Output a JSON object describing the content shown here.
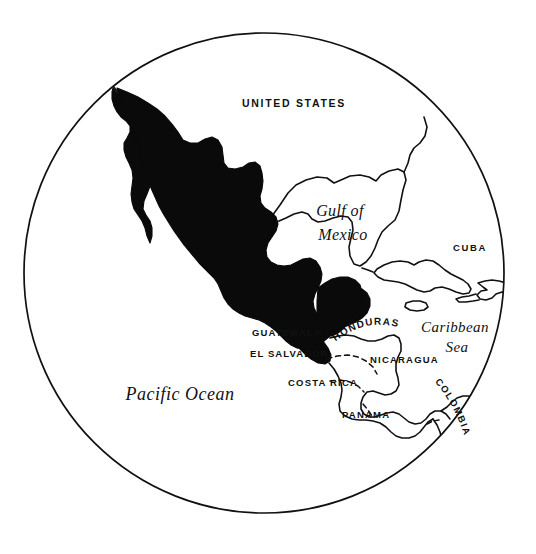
{
  "map": {
    "title": "Mexico and Central America",
    "projection": "circular globe inset",
    "style": {
      "background": "#ffffff",
      "ink": "#111111",
      "highlight_fill": "#0a0a0a",
      "highlight_country": "Mexico"
    },
    "circle": {
      "center_x": 264,
      "center_y": 273,
      "radius": 241
    },
    "labels": [
      {
        "id": "united-states",
        "text": "UNITED STATES",
        "kind": "country",
        "style": "sans-caps",
        "x": 294,
        "y": 107,
        "size": 10.5,
        "letter_spacing": 1.7,
        "anchor": "middle",
        "rotation": 0
      },
      {
        "id": "gulf-of-mexico-line1",
        "text": "Gulf of",
        "kind": "water",
        "style": "script",
        "x": 340,
        "y": 216,
        "size": 16,
        "letter_spacing": 0.4,
        "anchor": "middle",
        "rotation": 0
      },
      {
        "id": "gulf-of-mexico-line2",
        "text": "Mexico",
        "kind": "water",
        "style": "script",
        "x": 343,
        "y": 240,
        "size": 16,
        "letter_spacing": 0.4,
        "anchor": "middle",
        "rotation": 0
      },
      {
        "id": "cuba",
        "text": "CUBA",
        "kind": "country",
        "style": "sans-caps",
        "x": 470,
        "y": 251,
        "size": 9.5,
        "letter_spacing": 1.7,
        "anchor": "middle",
        "rotation": 0
      },
      {
        "id": "caribbean-sea-line1",
        "text": "Caribbean",
        "kind": "water",
        "style": "script",
        "x": 455,
        "y": 332,
        "size": 15,
        "letter_spacing": 0.4,
        "anchor": "middle",
        "rotation": 0
      },
      {
        "id": "caribbean-sea-line2",
        "text": "Sea",
        "kind": "water",
        "style": "script",
        "x": 457,
        "y": 352,
        "size": 15,
        "letter_spacing": 0.4,
        "anchor": "middle",
        "rotation": 0
      },
      {
        "id": "guatemala",
        "text": "GUATEMALA",
        "kind": "country",
        "style": "sans-caps",
        "x": 252,
        "y": 336,
        "size": 9.5,
        "letter_spacing": 1.1,
        "anchor": "start",
        "rotation": 0
      },
      {
        "id": "el-salvador",
        "text": "EL SALVADOR",
        "kind": "country",
        "style": "sans-caps",
        "x": 250,
        "y": 357,
        "size": 9.5,
        "letter_spacing": 1.1,
        "anchor": "start",
        "rotation": 0
      },
      {
        "id": "honduras",
        "text": "HONDURAS",
        "kind": "country",
        "style": "sans-caps-arc",
        "x": 340,
        "y": 333,
        "size": 10,
        "letter_spacing": 1.2,
        "anchor": "start",
        "rotation": 0
      },
      {
        "id": "nicaragua",
        "text": "NICARAGUA",
        "kind": "country",
        "style": "sans-caps",
        "x": 370,
        "y": 363,
        "size": 9.5,
        "letter_spacing": 1.2,
        "anchor": "start",
        "rotation": 0
      },
      {
        "id": "costa-rica",
        "text": "COSTA RICA",
        "kind": "country",
        "style": "sans-caps",
        "x": 288,
        "y": 386,
        "size": 9.5,
        "letter_spacing": 1.2,
        "anchor": "start",
        "rotation": 0
      },
      {
        "id": "panama",
        "text": "PANAMA",
        "kind": "country",
        "style": "sans-caps",
        "x": 342,
        "y": 418,
        "size": 9.5,
        "letter_spacing": 1.2,
        "anchor": "start",
        "rotation": 0
      },
      {
        "id": "colombia",
        "text": "COLOMBIA",
        "kind": "country",
        "style": "sans-caps-arc",
        "x": 440,
        "y": 390,
        "size": 9.5,
        "letter_spacing": 1.4,
        "anchor": "start",
        "rotation": 58
      },
      {
        "id": "pacific-ocean",
        "text": "Pacific Ocean",
        "kind": "water",
        "style": "script",
        "x": 180,
        "y": 400,
        "size": 18,
        "letter_spacing": 0.5,
        "anchor": "middle",
        "rotation": 0
      }
    ],
    "features": {
      "highlighted": [
        "Mexico"
      ],
      "outlined": [
        "United States",
        "Cuba",
        "Jamaica",
        "Hispaniola",
        "Belize",
        "Honduras",
        "Nicaragua",
        "Costa Rica",
        "Panama",
        "Colombia"
      ],
      "dashed_borders": [
        "Honduras-Nicaragua",
        "Nicaragua-Costa Rica",
        "Costa Rica-Panama",
        "Panama-Colombia"
      ]
    }
  }
}
